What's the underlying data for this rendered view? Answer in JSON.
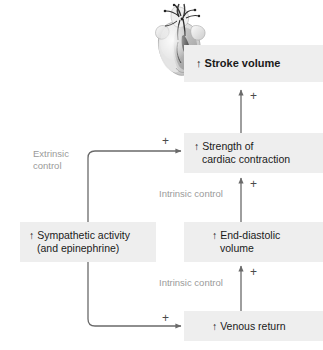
{
  "diagram": {
    "colors": {
      "box_fill": "#eeeeee",
      "text": "#1a1a1a",
      "label_gray": "#9a9a9a",
      "arrow": "#6a6a6a",
      "plus": "#4a4a4a"
    },
    "nodes": [
      {
        "id": "stroke-volume",
        "line1": "↑ Stroke volume",
        "line2": "",
        "bold": true
      },
      {
        "id": "cardiac-contraction",
        "line1": "↑ Strength of",
        "line2": "cardiac contraction",
        "bold": false
      },
      {
        "id": "sympathetic-activity",
        "line1": "↑ Sympathetic activity",
        "line2": "(and epinephrine)",
        "bold": false
      },
      {
        "id": "end-diastolic-volume",
        "line1": "↑ End-diastolic",
        "line2": "volume",
        "bold": false
      },
      {
        "id": "venous-return",
        "line1": "↑ Venous return",
        "line2": "",
        "bold": false
      }
    ],
    "control_labels": {
      "extrinsic_line1": "Extrinsic",
      "extrinsic_line2": "control",
      "intrinsic_upper": "Intrinsic control",
      "intrinsic_lower": "Intrinsic control"
    },
    "plus_signs": {
      "to_stroke_volume": "+",
      "to_contraction_from_sympathetic": "+",
      "to_contraction_from_edv": "+",
      "to_edv_from_venous_return": "+",
      "to_venous_return_from_sympathetic": "+"
    },
    "illustration": {
      "name": "heart-illustration",
      "alt": "anatomical heart"
    }
  }
}
